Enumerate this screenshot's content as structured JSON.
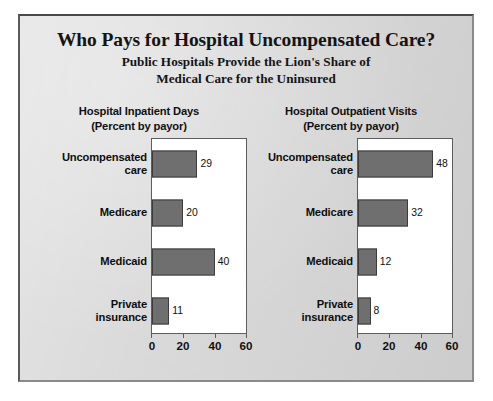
{
  "header": {
    "title": "Who Pays for Hospital Uncompensated Care?",
    "subtitle_line1": "Public Hospitals Provide the Lion's Share of",
    "subtitle_line2": "Medical Care for the Uninsured"
  },
  "colors": {
    "background": "#d9d9d9",
    "bar_fill": "#6f6f6f",
    "bar_outline": "#3c3c3c",
    "plot_background": "#ffffff",
    "frame": "#5d5d5d",
    "text": "#111111"
  },
  "panels": [
    {
      "heading": "Hospital Inpatient Days",
      "subheading": "(Percent by payor)"
    },
    {
      "heading": "Hospital Outpatient Visits",
      "subheading": "(Percent by payor)"
    }
  ],
  "axis": {
    "ticks": [
      "0",
      "20",
      "40",
      "60"
    ]
  },
  "chart_data": [
    {
      "type": "bar",
      "orientation": "horizontal",
      "title": "Hospital Inpatient Days",
      "subtitle": "(Percent by payor)",
      "xlabel": "",
      "ylabel": "",
      "categories": [
        "Uncompensated care",
        "Medicare",
        "Medicaid",
        "Private insurance"
      ],
      "values": [
        29,
        20,
        40,
        11
      ],
      "data_labels": [
        "29",
        "20",
        "40",
        "11"
      ],
      "xlim": [
        0,
        60
      ],
      "xticks": [
        0,
        20,
        40,
        60
      ],
      "grid": false,
      "legend": false,
      "units": "percent"
    },
    {
      "type": "bar",
      "orientation": "horizontal",
      "title": "Hospital Outpatient Visits",
      "subtitle": "(Percent by payor)",
      "xlabel": "",
      "ylabel": "",
      "categories": [
        "Uncompensated care",
        "Medicare",
        "Medicaid",
        "Private insurance"
      ],
      "values": [
        48,
        32,
        12,
        8
      ],
      "data_labels": [
        "48",
        "32",
        "12",
        "8"
      ],
      "xlim": [
        0,
        60
      ],
      "xticks": [
        0,
        20,
        40,
        60
      ],
      "grid": false,
      "legend": false,
      "units": "percent"
    }
  ],
  "category_labels": [
    {
      "line1": "Uncompensated",
      "line2": "care"
    },
    {
      "line1": "Medicare",
      "line2": ""
    },
    {
      "line1": "Medicaid",
      "line2": ""
    },
    {
      "line1": "Private",
      "line2": "insurance"
    }
  ]
}
